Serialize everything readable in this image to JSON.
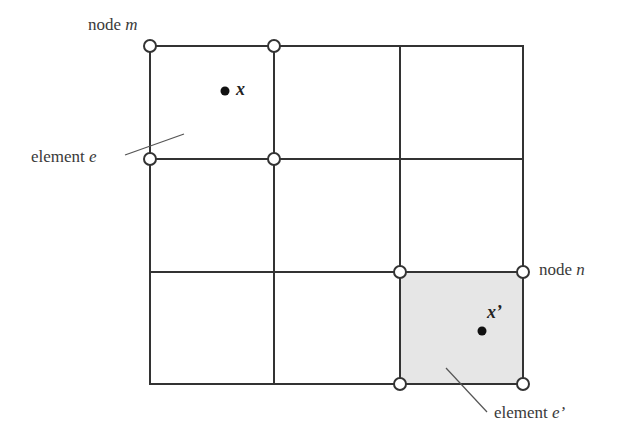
{
  "diagram": {
    "type": "finite-element-mesh",
    "grid": {
      "columns": 3,
      "rows": 3
    },
    "colors": {
      "line": "#333333",
      "shaded_element": "#e6e6e6",
      "background": "#ffffff"
    }
  },
  "labels": {
    "node_m": {
      "prefix": "node ",
      "var": "m"
    },
    "node_n": {
      "prefix": "node ",
      "var": "n"
    },
    "element_e": {
      "prefix": "element ",
      "var": "e"
    },
    "element_e_prime": {
      "prefix": "element ",
      "var": "e’"
    },
    "point_x": "x",
    "point_x_prime": "x’"
  }
}
